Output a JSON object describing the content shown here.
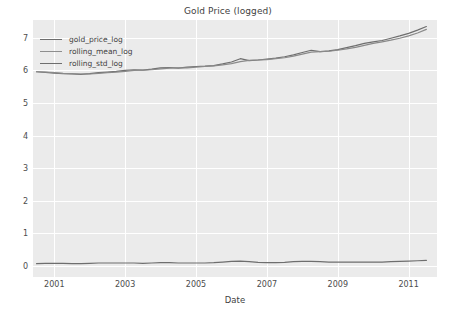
{
  "chart_data": {
    "type": "line",
    "title": "Gold Price (logged)",
    "xlabel": "Date",
    "ylabel": "",
    "xlim": [
      2000.4,
      2011.8
    ],
    "ylim": [
      -0.35,
      7.55
    ],
    "grid": true,
    "legend_position": "upper left",
    "xticks": [
      "2001",
      "2003",
      "2005",
      "2007",
      "2009",
      "2011"
    ],
    "xtick_values": [
      2001,
      2003,
      2005,
      2007,
      2009,
      2011
    ],
    "yticks": [
      "0",
      "1",
      "2",
      "3",
      "4",
      "5",
      "6",
      "7"
    ],
    "ytick_values": [
      0,
      1,
      2,
      3,
      4,
      5,
      6,
      7
    ],
    "colors": {
      "gold_price_log": "#6e6e6e",
      "rolling_mean_log": "#8a8a8a",
      "rolling_std_log": "#6e6e6e",
      "plot_background": "#ebebeb",
      "gridline": "#ffffff",
      "figure_background": "#ffffff",
      "text": "#4c4c4c"
    },
    "x": [
      2000.5,
      2000.75,
      2001.0,
      2001.25,
      2001.5,
      2001.75,
      2002.0,
      2002.25,
      2002.5,
      2002.75,
      2003.0,
      2003.25,
      2003.5,
      2003.75,
      2004.0,
      2004.25,
      2004.5,
      2004.75,
      2005.0,
      2005.25,
      2005.5,
      2005.75,
      2006.0,
      2006.25,
      2006.5,
      2006.75,
      2007.0,
      2007.25,
      2007.5,
      2007.75,
      2008.0,
      2008.25,
      2008.5,
      2008.75,
      2009.0,
      2009.25,
      2009.5,
      2009.75,
      2010.0,
      2010.25,
      2010.5,
      2010.75,
      2011.0,
      2011.25,
      2011.5
    ],
    "series": [
      {
        "name": "gold_price_log",
        "values": [
          5.96,
          5.94,
          5.92,
          5.9,
          5.89,
          5.88,
          5.9,
          5.93,
          5.95,
          5.97,
          6.0,
          6.02,
          6.01,
          6.04,
          6.08,
          6.09,
          6.07,
          6.1,
          6.12,
          6.13,
          6.15,
          6.2,
          6.26,
          6.36,
          6.3,
          6.32,
          6.35,
          6.38,
          6.42,
          6.48,
          6.55,
          6.62,
          6.58,
          6.6,
          6.64,
          6.7,
          6.76,
          6.83,
          6.88,
          6.92,
          6.99,
          7.06,
          7.14,
          7.24,
          7.35
        ]
      },
      {
        "name": "rolling_mean_log",
        "values": [
          5.96,
          5.95,
          5.93,
          5.91,
          5.9,
          5.89,
          5.89,
          5.91,
          5.93,
          5.95,
          5.97,
          6.0,
          6.01,
          6.02,
          6.05,
          6.07,
          6.08,
          6.08,
          6.1,
          6.12,
          6.14,
          6.17,
          6.21,
          6.27,
          6.31,
          6.32,
          6.33,
          6.36,
          6.39,
          6.44,
          6.5,
          6.56,
          6.58,
          6.59,
          6.62,
          6.66,
          6.71,
          6.77,
          6.83,
          6.88,
          6.93,
          6.99,
          7.06,
          7.15,
          7.26
        ]
      },
      {
        "name": "rolling_std_log",
        "values": [
          0.06,
          0.07,
          0.07,
          0.07,
          0.06,
          0.06,
          0.07,
          0.08,
          0.08,
          0.08,
          0.08,
          0.08,
          0.07,
          0.08,
          0.09,
          0.09,
          0.08,
          0.08,
          0.08,
          0.08,
          0.09,
          0.11,
          0.13,
          0.14,
          0.12,
          0.1,
          0.09,
          0.09,
          0.1,
          0.12,
          0.13,
          0.13,
          0.12,
          0.11,
          0.11,
          0.11,
          0.11,
          0.11,
          0.11,
          0.11,
          0.12,
          0.13,
          0.14,
          0.15,
          0.16
        ]
      }
    ]
  },
  "legend": {
    "entries": [
      {
        "label": "gold_price_log",
        "color": "#6e6e6e"
      },
      {
        "label": "rolling_mean_log",
        "color": "#8e8e8e"
      },
      {
        "label": "rolling_std_log",
        "color": "#6e6e6e"
      }
    ]
  }
}
